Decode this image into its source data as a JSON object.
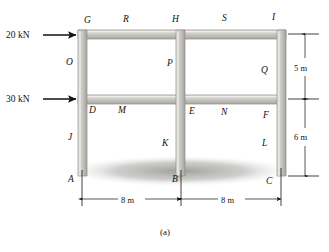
{
  "figure": {
    "caption": "(a)",
    "type": "structural-frame-diagram",
    "forces": [
      {
        "id": "force-top",
        "label": "20 kN",
        "applied_at": "G",
        "direction": "right"
      },
      {
        "id": "force-middle",
        "label": "30 kN",
        "applied_at": "D",
        "direction": "right"
      }
    ],
    "dimensions": {
      "vertical": [
        {
          "id": "dim-5m",
          "label": "5 m",
          "between": [
            "I",
            "F"
          ]
        },
        {
          "id": "dim-6m",
          "label": "6 m",
          "between": [
            "F",
            "C"
          ]
        }
      ],
      "horizontal": [
        {
          "id": "dim-span-left",
          "label": "8 m",
          "between": [
            "A",
            "B"
          ]
        },
        {
          "id": "dim-span-right",
          "label": "8 m",
          "between": [
            "B",
            "C"
          ]
        }
      ]
    },
    "joint_labels": [
      {
        "name": "G",
        "x": 84,
        "y": 23
      },
      {
        "name": "R",
        "x": 123,
        "y": 22
      },
      {
        "name": "H",
        "x": 172,
        "y": 22
      },
      {
        "name": "S",
        "x": 222,
        "y": 21
      },
      {
        "name": "I",
        "x": 272,
        "y": 20
      },
      {
        "name": "O",
        "x": 71,
        "y": 62
      },
      {
        "name": "P",
        "x": 167,
        "y": 63
      },
      {
        "name": "Q",
        "x": 261,
        "y": 70
      },
      {
        "name": "D",
        "x": 92,
        "y": 110
      },
      {
        "name": "M",
        "x": 121,
        "y": 110
      },
      {
        "name": "E",
        "x": 192,
        "y": 111
      },
      {
        "name": "N",
        "x": 224,
        "y": 112
      },
      {
        "name": "F",
        "x": 265,
        "y": 115
      },
      {
        "name": "J",
        "x": 72,
        "y": 137
      },
      {
        "name": "K",
        "x": 165,
        "y": 143
      },
      {
        "name": "L",
        "x": 265,
        "y": 143
      },
      {
        "name": "A",
        "x": 72,
        "y": 180
      },
      {
        "name": "B",
        "x": 176,
        "y": 180
      },
      {
        "name": "C",
        "x": 269,
        "y": 182
      }
    ],
    "colors": {
      "member_fill": "#c9c7c2",
      "member_edge": "#8e8c88",
      "ink": "#14110f",
      "ground_shadow": "#9a9a98",
      "background": "#ffffff"
    }
  }
}
